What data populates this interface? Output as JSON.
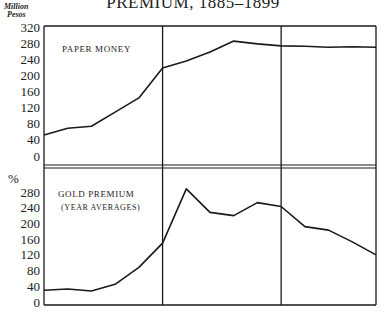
{
  "title": "PREMIUM, 1885–1899",
  "top_panel": {
    "unit_line1": "Million",
    "unit_line2": "Pesos",
    "label": "PAPER MONEY"
  },
  "bottom_panel": {
    "unit": "%",
    "label": "GOLD PREMIUM",
    "sublabel": "(YEAR AVERAGES)"
  },
  "chart_data": [
    {
      "type": "line",
      "title": "PAPER MONEY",
      "xlabel": "",
      "ylabel": "Million Pesos",
      "x": [
        1885,
        1886,
        1887,
        1888,
        1889,
        1890,
        1891,
        1892,
        1893,
        1894,
        1895,
        1896,
        1897,
        1898,
        1899
      ],
      "series": [
        {
          "name": "Paper Money",
          "values": [
            52,
            69,
            74,
            109,
            144,
            218,
            236,
            258,
            285,
            278,
            273,
            272,
            270,
            271,
            270
          ]
        }
      ],
      "yticks": [
        0,
        40,
        80,
        120,
        160,
        200,
        240,
        280,
        320
      ],
      "ylim": [
        0,
        320
      ],
      "vertical_dividers": [
        1890,
        1895
      ],
      "grid": false
    },
    {
      "type": "line",
      "title": "GOLD PREMIUM (Year Averages)",
      "xlabel": "",
      "ylabel": "%",
      "x": [
        1885,
        1886,
        1887,
        1888,
        1889,
        1890,
        1891,
        1892,
        1893,
        1894,
        1895,
        1896,
        1897,
        1898,
        1899
      ],
      "series": [
        {
          "name": "Gold Premium",
          "values": [
            30,
            33,
            28,
            45,
            88,
            150,
            288,
            228,
            220,
            253,
            243,
            192,
            183,
            153,
            120
          ]
        }
      ],
      "yticks": [
        0,
        40,
        80,
        120,
        160,
        200,
        240,
        280
      ],
      "ylim": [
        0,
        280
      ],
      "vertical_dividers": [
        1890,
        1895
      ],
      "grid": false
    }
  ]
}
